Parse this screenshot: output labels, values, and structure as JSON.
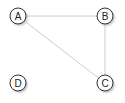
{
  "graph": {
    "nodes": [
      {
        "id": "A",
        "label": "A",
        "x": 18,
        "y": 16
      },
      {
        "id": "B",
        "label": "B",
        "x": 105,
        "y": 16
      },
      {
        "id": "C",
        "label": "C",
        "x": 105,
        "y": 83
      },
      {
        "id": "D",
        "label": "D",
        "x": 18,
        "y": 83
      }
    ],
    "edges": [
      {
        "from": "A",
        "to": "B"
      },
      {
        "from": "A",
        "to": "C"
      },
      {
        "from": "B",
        "to": "C"
      }
    ],
    "colors": {
      "edge": "#cccccc",
      "node_stroke": "#333333",
      "node_fill": "#ffffff",
      "shadow": "#bbbbbb"
    }
  }
}
